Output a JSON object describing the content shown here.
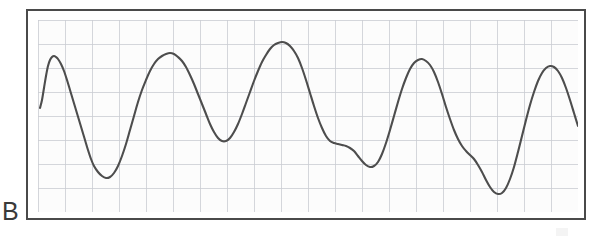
{
  "figure": {
    "panel_label": "B",
    "frame": {
      "x": 26,
      "y": 9,
      "width": 560,
      "height": 211,
      "border_color": "#4a4a4a",
      "border_width": 2
    },
    "plot": {
      "x": 10,
      "y": 9,
      "width": 540,
      "height": 192,
      "background_color": "#fcfcfc"
    }
  },
  "style": {
    "grid_color": "#c9ccd2",
    "trace_color": "#4d4d4d",
    "trace_width": 2.1,
    "label_color": "#3a3a3a",
    "paper_color": "#fcfcfc",
    "page_background": "#ffffff"
  },
  "chart_data": {
    "type": "line",
    "title": "",
    "subtitle": "",
    "xlabel": "",
    "ylabel": "",
    "annotations": [
      "B"
    ],
    "legend": [],
    "legend_position": "none",
    "grid": true,
    "grid_major_x_count": 20,
    "grid_major_y_count": 8,
    "xlim": [
      0,
      540
    ],
    "ylim": [
      0,
      192
    ],
    "y_direction": "inverted_pixels",
    "series": [
      {
        "name": "waveform",
        "color": "#4d4d4d",
        "x": [
          2,
          4,
          6,
          8,
          10,
          12,
          14,
          16,
          18,
          20,
          23,
          26,
          29,
          32,
          35,
          38,
          41,
          44,
          47,
          50,
          53,
          56,
          60,
          64,
          68,
          72,
          76,
          80,
          84,
          88,
          92,
          96,
          100,
          104,
          108,
          112,
          116,
          120,
          124,
          128,
          132,
          136,
          140,
          144,
          148,
          152,
          156,
          160,
          164,
          168,
          172,
          176,
          180,
          184,
          188,
          192,
          196,
          200,
          204,
          208,
          212,
          216,
          220,
          224,
          228,
          232,
          236,
          240,
          244,
          248,
          252,
          256,
          260,
          264,
          268,
          272,
          276,
          280,
          284,
          288,
          292,
          296,
          300,
          304,
          308,
          312,
          316,
          320,
          324,
          328,
          332,
          336,
          340,
          344,
          348,
          352,
          356,
          360,
          364,
          368,
          372,
          376,
          380,
          384,
          388,
          392,
          396,
          400,
          404,
          408,
          412,
          416,
          420,
          424,
          428,
          432,
          436,
          440,
          444,
          448,
          452,
          456,
          460,
          464,
          468,
          472,
          476,
          480,
          484,
          488,
          492,
          496,
          500,
          504,
          508,
          512,
          516,
          520,
          524,
          528,
          532,
          536,
          540
        ],
        "y": [
          88,
          80,
          68,
          56,
          46,
          40,
          37,
          36,
          37,
          39,
          44,
          51,
          60,
          70,
          80,
          90,
          100,
          110,
          120,
          130,
          139,
          146,
          152,
          156,
          158,
          157,
          153,
          146,
          136,
          124,
          110,
          96,
          82,
          70,
          60,
          51,
          44,
          39,
          36,
          34,
          33,
          34,
          37,
          41,
          47,
          55,
          64,
          74,
          84,
          94,
          104,
          112,
          118,
          121,
          121,
          118,
          112,
          104,
          94,
          83,
          72,
          61,
          51,
          42,
          35,
          29,
          25,
          23,
          22,
          23,
          26,
          31,
          38,
          48,
          60,
          73,
          86,
          98,
          108,
          116,
          121,
          123,
          124,
          125,
          126,
          128,
          131,
          136,
          141,
          145,
          147,
          146,
          142,
          134,
          123,
          110,
          96,
          82,
          69,
          58,
          49,
          43,
          40,
          39,
          41,
          45,
          52,
          62,
          74,
          87,
          99,
          110,
          119,
          126,
          131,
          135,
          139,
          145,
          152,
          160,
          167,
          172,
          174,
          173,
          168,
          159,
          147,
          132,
          116,
          100,
          85,
          72,
          61,
          53,
          48,
          46,
          47,
          51,
          58,
          68,
          80,
          93,
          106
        ]
      }
    ],
    "shape_summary": {
      "cycles": 13,
      "morphology": "quasi-periodic large-amplitude oscillation with sharp upstrokes, rounded peaks and broad troughs",
      "note": "final cycle ends with a tall narrow spike followed by a descending tail that terminates mid-field"
    }
  }
}
